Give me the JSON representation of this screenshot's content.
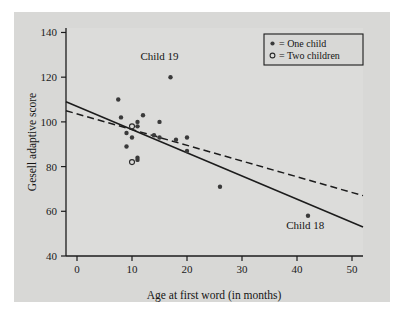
{
  "chart_data": {
    "type": "scatter",
    "title": "",
    "xlabel": "Age at first word (in months)",
    "ylabel": "Gesell adaptive score",
    "xlim": [
      -2,
      52
    ],
    "ylim": [
      40,
      142
    ],
    "xticks": [
      0,
      10,
      20,
      30,
      40,
      50
    ],
    "yticks": [
      40,
      60,
      80,
      100,
      120,
      140
    ],
    "grid": false,
    "legend_position": "top-right",
    "legend": [
      {
        "marker": "filled-dot",
        "label": "= One child"
      },
      {
        "marker": "open-circle",
        "label": "= Two children"
      }
    ],
    "points": [
      {
        "x": 7.5,
        "y": 110,
        "group": "one"
      },
      {
        "x": 8,
        "y": 102,
        "group": "one"
      },
      {
        "x": 9,
        "y": 95,
        "group": "one"
      },
      {
        "x": 9,
        "y": 89,
        "group": "one"
      },
      {
        "x": 10,
        "y": 98,
        "group": "two"
      },
      {
        "x": 10,
        "y": 93,
        "group": "one"
      },
      {
        "x": 10,
        "y": 82,
        "group": "two"
      },
      {
        "x": 11,
        "y": 100,
        "group": "one"
      },
      {
        "x": 11,
        "y": 98,
        "group": "one"
      },
      {
        "x": 11,
        "y": 84,
        "group": "one"
      },
      {
        "x": 11,
        "y": 83,
        "group": "one"
      },
      {
        "x": 12,
        "y": 103,
        "group": "one"
      },
      {
        "x": 14,
        "y": 94,
        "group": "one"
      },
      {
        "x": 15,
        "y": 100,
        "group": "one"
      },
      {
        "x": 15,
        "y": 93,
        "group": "one"
      },
      {
        "x": 17,
        "y": 120,
        "group": "one"
      },
      {
        "x": 18,
        "y": 92,
        "group": "one"
      },
      {
        "x": 20,
        "y": 93,
        "group": "one"
      },
      {
        "x": 20,
        "y": 87,
        "group": "one"
      },
      {
        "x": 26,
        "y": 71,
        "group": "one"
      },
      {
        "x": 42,
        "y": 58,
        "group": "one"
      }
    ],
    "lines": [
      {
        "name": "all-data-fit",
        "style": "solid",
        "x0": -2,
        "y0": 109,
        "x1": 52,
        "y1": 53
      },
      {
        "name": "outliers-removed-fit",
        "style": "dashed",
        "x0": -2,
        "y0": 105,
        "x1": 52,
        "y1": 67
      }
    ],
    "annotations": [
      {
        "name": "child-19",
        "text": "Child 19",
        "x": 15.0,
        "y": 127.5
      },
      {
        "name": "child-18",
        "text": "Child 18",
        "x": 41.5,
        "y": 52.0
      }
    ]
  },
  "colors": {
    "page_background": "#ffffff",
    "panel_background": "#d8d8d6",
    "plot_background": "#dcdcda",
    "axis": "#1c1c1c",
    "marker_filled": "#3a3a3a",
    "text": "#141414"
  },
  "axis": {
    "x_title": "Age at first word (in months)",
    "y_title": "Gesell adaptive score",
    "x_tick_labels": [
      "0",
      "10",
      "20",
      "30",
      "40",
      "50"
    ],
    "y_tick_labels": [
      "40",
      "60",
      "80",
      "100",
      "120",
      "140"
    ]
  },
  "legend": {
    "one_child": "= One child",
    "two_children": "= Two children"
  },
  "annotations": {
    "child_19": "Child 19",
    "child_18": "Child 18"
  }
}
